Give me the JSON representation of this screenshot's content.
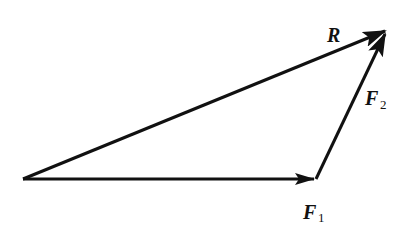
{
  "diagram": {
    "type": "vector-triangle",
    "vectors": [
      {
        "id": "F1",
        "label": "F",
        "subscript": "1",
        "from": [
          23,
          179
        ],
        "to": [
          316,
          179
        ]
      },
      {
        "id": "F2",
        "label": "F",
        "subscript": "2",
        "from": [
          316,
          179
        ],
        "to": [
          387,
          30
        ]
      },
      {
        "id": "R",
        "label": "R",
        "subscript": "",
        "from": [
          23,
          179
        ],
        "to": [
          387,
          30
        ]
      }
    ],
    "stroke_color": "#111111"
  },
  "labels": {
    "r": "R",
    "f1_main": "F",
    "f1_sub": "1",
    "f2_main": "F",
    "f2_sub": "2"
  }
}
